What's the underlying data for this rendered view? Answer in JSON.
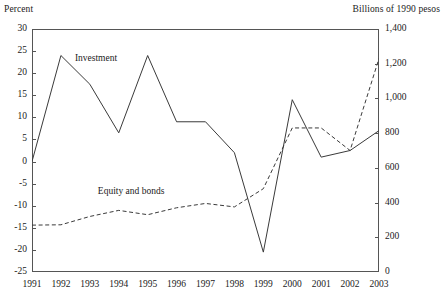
{
  "axis_titles": {
    "left_unit": "Percent",
    "right_unit": "Billions of 1990 pesos"
  },
  "annotations": {
    "investment": "Investment",
    "equity_and_bonds": "Equity and bonds"
  },
  "colors": {
    "line": "#3a3a3a",
    "axis": "#555555",
    "text": "#1a1a1a",
    "background": "#ffffff"
  },
  "chart_data": {
    "type": "line",
    "title": "",
    "subtitle": "",
    "xlabel": "",
    "ylabel": "Percent",
    "y2label": "Billions of 1990 pesos",
    "grid": false,
    "legend_position": "inline-annotation",
    "x": [
      1991,
      1992,
      1993,
      1994,
      1995,
      1996,
      1997,
      1998,
      1999,
      2000,
      2001,
      2002,
      2003
    ],
    "xtick_labels": [
      "1991",
      "1992",
      "1993",
      "1994",
      "1995",
      "1996",
      "1997",
      "1998",
      "1999",
      "2000",
      "2001",
      "2002",
      "2003"
    ],
    "ylim": [
      -25,
      30
    ],
    "ytick_labels": [
      "30",
      "25",
      "20",
      "15",
      "10",
      "5",
      "0",
      "-5",
      "-10",
      "-15",
      "-20",
      "-25"
    ],
    "ytick_values": [
      30,
      25,
      20,
      15,
      10,
      5,
      0,
      -5,
      -10,
      -15,
      -20,
      -25
    ],
    "y2lim": [
      0,
      1400
    ],
    "y2tick_labels": [
      "1,400",
      "1,200",
      "1,000",
      "800",
      "600",
      "400",
      "200",
      "0"
    ],
    "y2tick_values": [
      1400,
      1200,
      1000,
      800,
      600,
      400,
      200,
      0
    ],
    "series": [
      {
        "name": "Investment",
        "axis": "left",
        "style": "solid",
        "values": [
          0,
          24,
          17.5,
          6.5,
          24,
          9,
          9,
          2,
          -20.5,
          14,
          1,
          2.5,
          7
        ]
      },
      {
        "name": "Equity and bonds",
        "axis": "right",
        "style": "dashed",
        "values": [
          270,
          272,
          320,
          355,
          330,
          370,
          395,
          375,
          480,
          830,
          830,
          700,
          1230
        ]
      }
    ]
  }
}
